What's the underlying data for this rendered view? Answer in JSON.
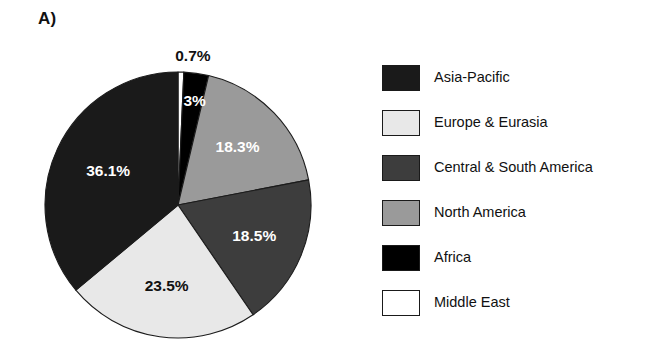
{
  "figure": {
    "panel_label": "A)",
    "background_color": "#ffffff"
  },
  "chart_data": {
    "type": "pie",
    "title": "",
    "subtitle": "",
    "xlabel": "",
    "ylabel": "",
    "legend_position": "right",
    "grid": false,
    "start_angle_deg": 0,
    "direction": "clockwise",
    "units": "percent",
    "categories": [
      "Middle East",
      "Africa",
      "North America",
      "Central & South America",
      "Europe & Eurasia",
      "Asia-Pacific"
    ],
    "values": [
      0.7,
      3.0,
      18.3,
      18.5,
      23.5,
      36.1
    ],
    "labels": [
      "0.7%",
      "3%",
      "18.3%",
      "18.5%",
      "23.5%",
      "36.1%"
    ],
    "colors": [
      "#ffffff",
      "#000000",
      "#9a9a9a",
      "#3d3d3d",
      "#e8e8e8",
      "#1a1a1a"
    ],
    "slices": [
      {
        "name": "Middle East",
        "value": 0.7,
        "label": "0.7%",
        "color": "#ffffff",
        "label_color": "#111111",
        "label_placement": "outside"
      },
      {
        "name": "Africa",
        "value": 3.0,
        "label": "3%",
        "color": "#000000",
        "label_color": "#ffffff",
        "label_placement": "inside"
      },
      {
        "name": "North America",
        "value": 18.3,
        "label": "18.3%",
        "color": "#9a9a9a",
        "label_color": "#ffffff",
        "label_placement": "inside"
      },
      {
        "name": "Central & South America",
        "value": 18.5,
        "label": "18.5%",
        "color": "#3d3d3d",
        "label_color": "#ffffff",
        "label_placement": "inside"
      },
      {
        "name": "Europe & Eurasia",
        "value": 23.5,
        "label": "23.5%",
        "color": "#e8e8e8",
        "label_color": "#111111",
        "label_placement": "inside"
      },
      {
        "name": "Asia-Pacific",
        "value": 36.1,
        "label": "36.1%",
        "color": "#1a1a1a",
        "label_color": "#ffffff",
        "label_placement": "inside"
      }
    ]
  },
  "legend": {
    "items": [
      {
        "label": "Asia-Pacific",
        "color": "#1a1a1a"
      },
      {
        "label": "Europe & Eurasia",
        "color": "#e8e8e8"
      },
      {
        "label": "Central & South America",
        "color": "#3d3d3d"
      },
      {
        "label": "North America",
        "color": "#9a9a9a"
      },
      {
        "label": "Africa",
        "color": "#000000"
      },
      {
        "label": "Middle East",
        "color": "#ffffff"
      }
    ]
  }
}
